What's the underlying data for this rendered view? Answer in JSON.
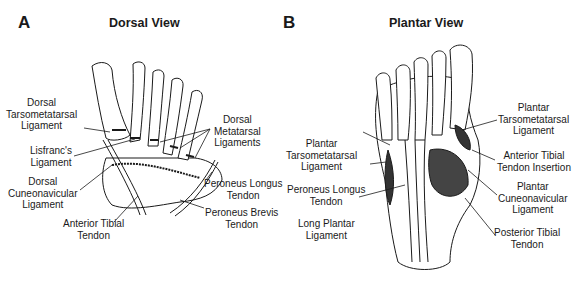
{
  "panels": [
    {
      "letter": "A",
      "title": "Dorsal View",
      "labels": {
        "dorsal_tmt": [
          "Dorsal",
          "Tarsometatarsal",
          "Ligament"
        ],
        "lisfranc": [
          "Lisfranc's",
          "Ligament"
        ],
        "dorsal_cn": [
          "Dorsal",
          "Cuneonavicular",
          "Ligament"
        ],
        "ant_tibial": [
          "Anterior Tibial",
          "Tendon"
        ],
        "dorsal_mt": [
          "Dorsal",
          "Metatarsal",
          "Ligaments"
        ],
        "peroneus_longus": [
          "Peroneus Longus",
          "Tendon"
        ],
        "peroneus_brevis": [
          "Peroneus Brevis",
          "Tendon"
        ]
      }
    },
    {
      "letter": "B",
      "title": "Plantar View",
      "labels": {
        "plantar_tmt_left": [
          "Plantar",
          "Tarsometatarsal",
          "Ligament"
        ],
        "peroneus_longus": [
          "Peroneus Longus",
          "Tendon"
        ],
        "long_plantar": [
          "Long Plantar",
          "Ligament"
        ],
        "plantar_tmt_right": [
          "Plantar",
          "Tarsometatarsal",
          "Ligament"
        ],
        "ant_tibial_insertion": [
          "Anterior Tibial",
          "Tendon Insertion"
        ],
        "plantar_cn": [
          "Plantar",
          "Cuneonavicular",
          "Ligament"
        ],
        "post_tibial": [
          "Posterior Tibial",
          "Tendon"
        ]
      }
    }
  ],
  "colors": {
    "ink": "#1a1a1a",
    "background": "#ffffff"
  }
}
